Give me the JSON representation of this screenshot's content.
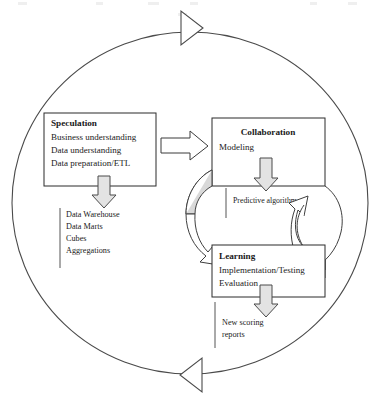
{
  "diagram": {
    "cycle_direction": "clockwise",
    "colors": {
      "ring_stroke": "#4a4a4a",
      "box_stroke": "#2b2b2b",
      "box_fill": "#ffffff",
      "arrow_fill_gray": "#e3e3e3",
      "arrow_fill_hollow": "#ffffff",
      "curve_shade": "#d9d9d9",
      "text": "#1a1a1a"
    },
    "boxes": [
      {
        "id": "speculation",
        "title": "Speculation",
        "lines": [
          "Business understanding",
          "Data understanding",
          "Data preparation/ETL"
        ],
        "title_align": "left"
      },
      {
        "id": "collaboration",
        "title": "Collaboration",
        "lines": [
          "Modeling"
        ],
        "title_align": "center"
      },
      {
        "id": "learning",
        "title": "Learning",
        "lines": [
          "Implementation/Testing",
          "Evaluation"
        ],
        "title_align": "left"
      }
    ],
    "annotations": [
      {
        "id": "speculation-outputs",
        "lines": [
          "Data Warehouse",
          "Data Marts",
          "Cubes",
          "Aggregations"
        ]
      },
      {
        "id": "collaboration-output",
        "lines": [
          "Predictive algorithm"
        ]
      },
      {
        "id": "learning-output",
        "lines": [
          "New scoring",
          "reports"
        ]
      }
    ],
    "arrows": [
      {
        "id": "speculation-to-collaboration",
        "shape": "block-arrow",
        "direction": "right"
      },
      {
        "id": "speculation-to-outputs",
        "shape": "block-arrow",
        "direction": "down"
      },
      {
        "id": "collaboration-to-output",
        "shape": "block-arrow",
        "direction": "down"
      },
      {
        "id": "learning-to-output",
        "shape": "block-arrow",
        "direction": "down"
      },
      {
        "id": "collaboration-to-learning",
        "shape": "curved-arrow",
        "direction": "down-left"
      },
      {
        "id": "learning-to-collaboration",
        "shape": "curved-arrow",
        "direction": "up-right"
      },
      {
        "id": "cycle-top",
        "shape": "triangle",
        "direction": "right"
      },
      {
        "id": "cycle-bottom",
        "shape": "triangle",
        "direction": "left"
      }
    ]
  }
}
